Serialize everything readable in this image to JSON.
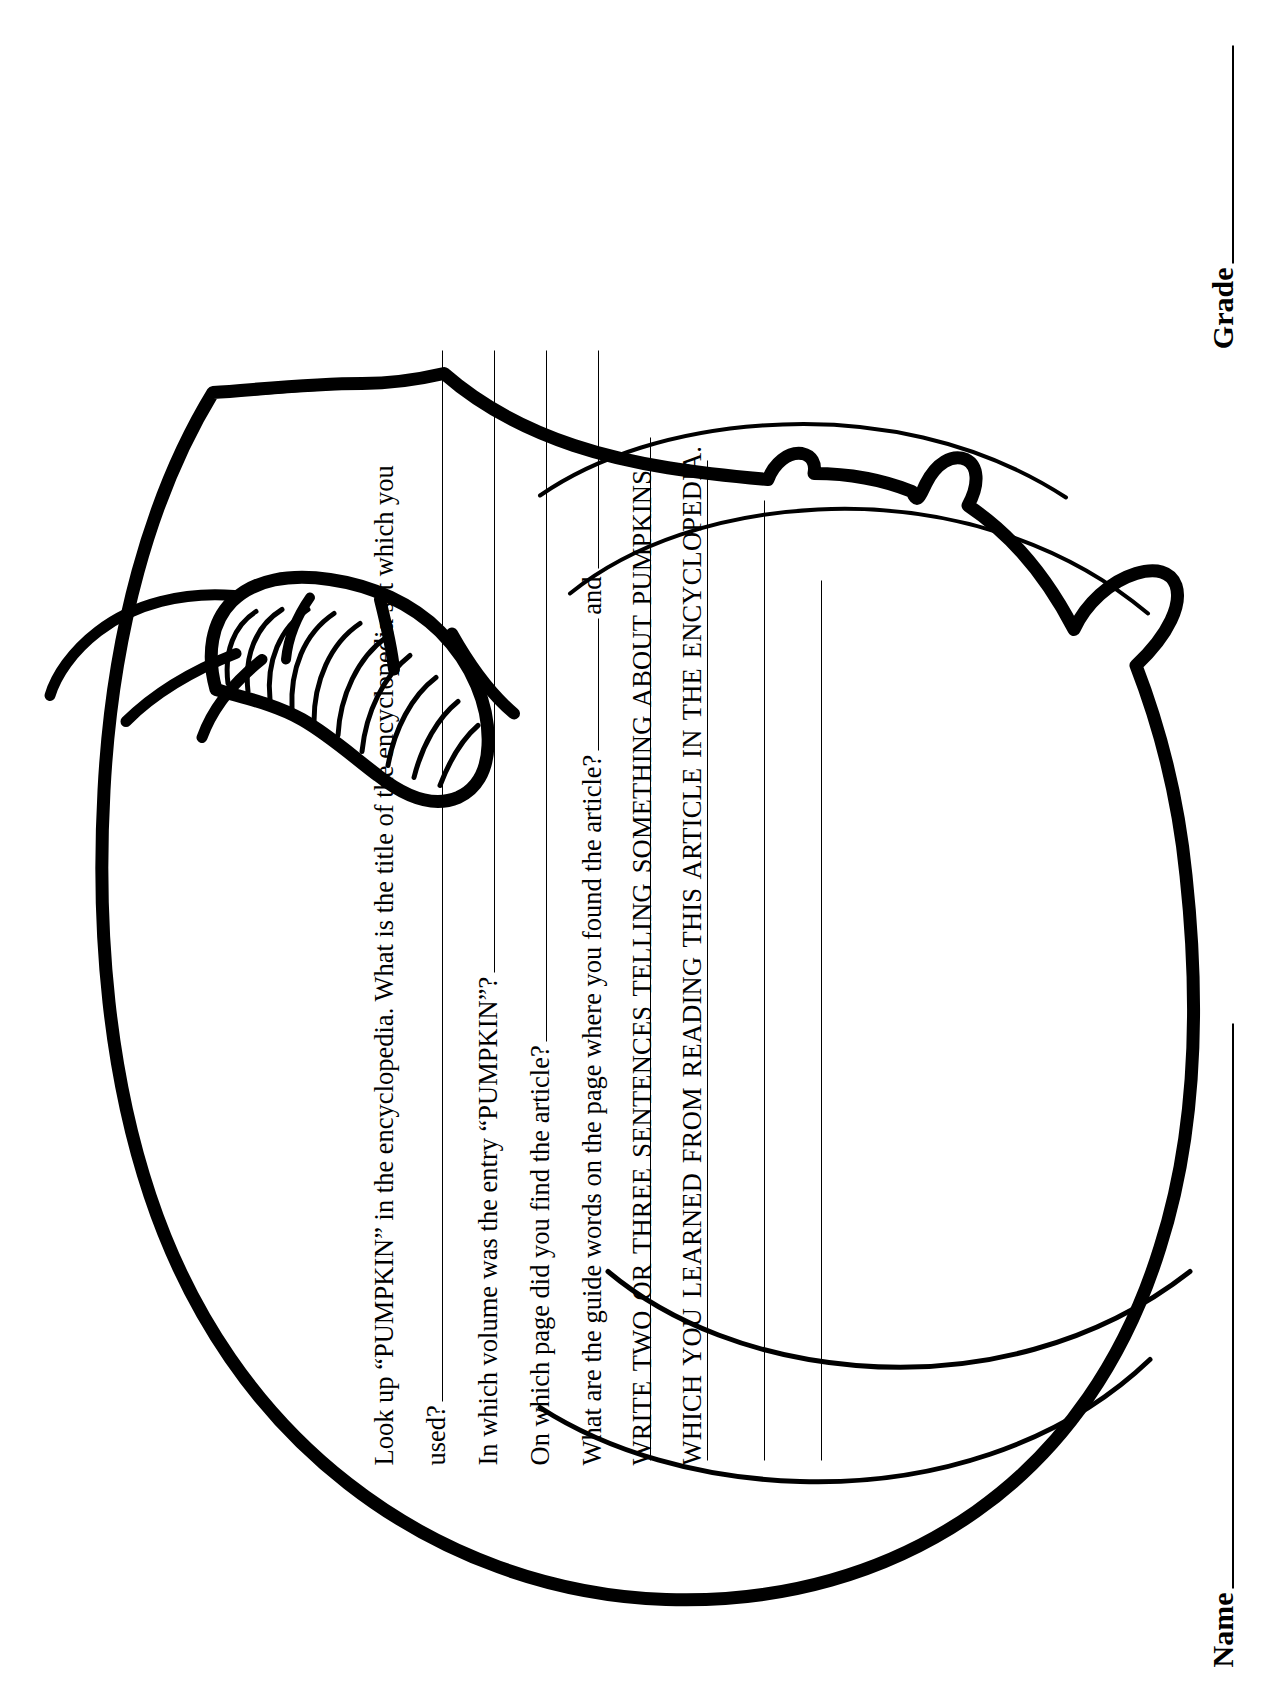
{
  "worksheet": {
    "subject": "pumpkin-encyclopedia-worksheet",
    "questions": [
      {
        "id": "q1",
        "text_part_1": "Look up “PUMPKIN” in the encyclopedia. What is the title of the encyclopedia set which you",
        "text_part_2": "used?"
      },
      {
        "id": "q2",
        "text": "In which volume was the entry “PUMPKIN”?"
      },
      {
        "id": "q3",
        "text": "On which page did you find the article?"
      },
      {
        "id": "q4",
        "text": "What are the guide words on the page where you found the article?",
        "conjunction": "and"
      }
    ],
    "instruction": {
      "line_1": "WRITE TWO OR THREE SENTENCES TELLING SOMETHING ABOUT PUMPKINS",
      "line_2": "WHICH YOU LEARNED FROM READING THIS ARTICLE IN THE ENCYCLOPEDIA."
    },
    "answer_line_count": 4,
    "footer": {
      "name_label": "Name",
      "grade_label": "Grade"
    }
  },
  "artwork": {
    "illustration": "pumpkin-with-stem-and-tendrils",
    "ink_color": "#000000",
    "paper_color": "#ffffff",
    "rib_count": 4
  }
}
